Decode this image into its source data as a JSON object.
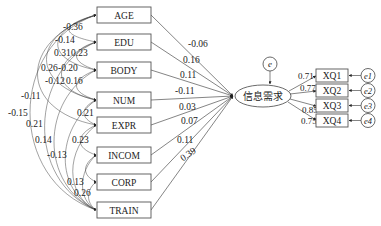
{
  "diagram": {
    "type": "structural-equation-model",
    "latent": {
      "label": "信息需求",
      "error": "e"
    },
    "predictors": [
      {
        "label": "AGE",
        "coef": "-0.06"
      },
      {
        "label": "EDU",
        "coef": "0.16"
      },
      {
        "label": "BODY",
        "coef": "0.11"
      },
      {
        "label": "NUM",
        "coef": "-0.11"
      },
      {
        "label": "EXPR",
        "coef": "0.03"
      },
      {
        "label": "INCOM",
        "coef": "0.07"
      },
      {
        "label": "CORP",
        "coef": "0.11"
      },
      {
        "label": "TRAIN",
        "coef": "0.39"
      }
    ],
    "indicators": [
      {
        "label": "XQ1",
        "loading": "0.71",
        "error": "e1"
      },
      {
        "label": "XQ2",
        "loading": "0.77",
        "error": "e2"
      },
      {
        "label": "XQ3",
        "loading": "0.85",
        "error": "e3"
      },
      {
        "label": "XQ4",
        "loading": "0.75",
        "error": "e4"
      }
    ],
    "correlations": [
      "-0.36",
      "-0.14",
      "0.31",
      "0.23",
      "0.26",
      "-0.20",
      "-0.12",
      "0.16",
      "-0.11",
      "-0.15",
      "0.21",
      "0.21",
      "0.14",
      "0.23",
      "-0.13",
      "0.13",
      "0.26"
    ]
  }
}
